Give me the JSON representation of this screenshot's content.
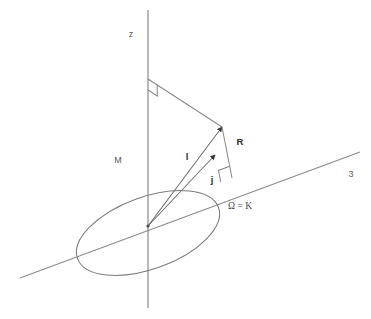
{
  "figure": {
    "background_color": "#ffffff",
    "line_color": "#8a8a8a",
    "label_color": "#4a4a4a",
    "accent_color": "#2e2e2e",
    "width": 371,
    "height": 319
  },
  "labels": {
    "z_axis": "z",
    "node_line_axis": "3",
    "mass_point": "M",
    "vector_l": "l",
    "vector_j": "j",
    "vector_R": "R",
    "ascending_node": "Ω = K"
  },
  "geometry": {
    "origin": {
      "x": 148,
      "y": 226
    },
    "z_axis": {
      "x": 148,
      "y_top": 10,
      "y_bottom": 308
    },
    "node_line": {
      "x1": 20,
      "y1": 278,
      "x2": 360,
      "y2": 152
    },
    "orbit_ellipse": {
      "cx": 148,
      "cy": 233,
      "rx": 75,
      "ry": 36,
      "rotation_deg": -20
    },
    "vector_l_tip": {
      "x": 222,
      "y": 127
    },
    "vector_j_tip": {
      "x": 215,
      "y": 155
    },
    "z_apex": {
      "x": 148,
      "y": 79
    },
    "R_foot": {
      "x": 232,
      "y": 178
    },
    "right_angle_top": {
      "x": 148,
      "y": 79
    },
    "right_angle_node": {
      "x": 232,
      "y": 178
    }
  },
  "label_positions": {
    "z_axis": {
      "x": 131,
      "y": 37
    },
    "node_line_axis": {
      "x": 351,
      "y": 177
    },
    "mass_point": {
      "x": 118,
      "y": 163
    },
    "vector_l": {
      "x": 187,
      "y": 160
    },
    "vector_j": {
      "x": 212,
      "y": 183
    },
    "vector_R": {
      "x": 240,
      "y": 145
    },
    "ascending_node": {
      "x": 228,
      "y": 209
    }
  }
}
